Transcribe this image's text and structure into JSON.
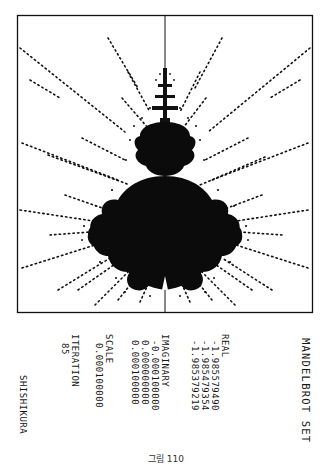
{
  "figure": {
    "title": "MANDELBROT SET",
    "real_label": "REAL",
    "real_values": [
      "-1.985579490",
      "-1.985479354",
      "-1.985379219"
    ],
    "imaginary_label": "IMAGINARY",
    "imaginary_values": [
      "-0.000100000",
      "0.000000000",
      "0.000100000"
    ],
    "scale_label": "SCALE",
    "scale_value": "0.000100000",
    "iteration_label": "ITERATION",
    "iteration_value": "85",
    "author": "SHISHIKURA",
    "caption": "그림 110",
    "colors": {
      "ink": "#111111",
      "paper": "#ffffff"
    }
  }
}
